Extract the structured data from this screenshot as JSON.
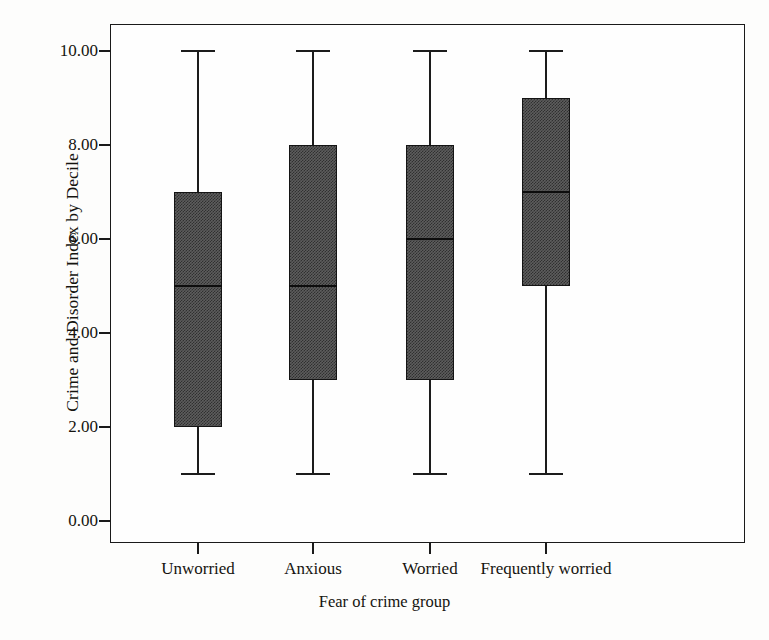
{
  "chart_data": {
    "type": "box",
    "title": "",
    "xlabel": "Fear of crime group",
    "ylabel": "Crime and Disorder Index by Decile",
    "categories": [
      "Unworried",
      "Anxious",
      "Worried",
      "Frequently worried"
    ],
    "ylim": [
      0,
      10.8
    ],
    "yticks": [
      0,
      2,
      4,
      6,
      8,
      10
    ],
    "ytick_labels": [
      "0.00",
      "2.00",
      "4.00",
      "6.00",
      "8.00",
      "10.00"
    ],
    "grid": false,
    "legend": null,
    "boxes": [
      {
        "category": "Unworried",
        "whisker_low": 1,
        "q1": 2,
        "median": 5,
        "q3": 7,
        "whisker_high": 10,
        "outliers": []
      },
      {
        "category": "Anxious",
        "whisker_low": 1,
        "q1": 3,
        "median": 5,
        "q3": 8,
        "whisker_high": 10,
        "outliers": []
      },
      {
        "category": "Worried",
        "whisker_low": 1,
        "q1": 3,
        "median": 6,
        "q3": 8,
        "whisker_high": 10,
        "outliers": []
      },
      {
        "category": "Frequently worried",
        "whisker_low": 1,
        "q1": 5,
        "median": 7,
        "q3": 9,
        "whisker_high": 10,
        "outliers": []
      }
    ],
    "colors": {
      "box_fill": "#5d5d5d",
      "box_edge": "#141414",
      "whisker": "#1c1c1c",
      "median": "#0d0d0d",
      "frame": "#1a1a1a",
      "background": "#fdfdfc",
      "text": "#15140f"
    }
  }
}
